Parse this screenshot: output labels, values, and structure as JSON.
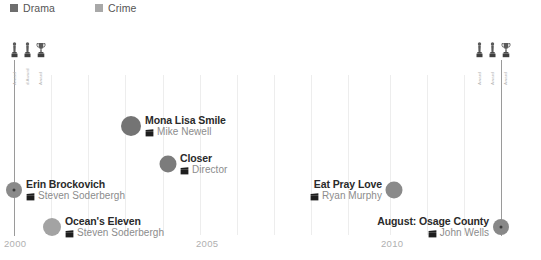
{
  "legend": {
    "items": [
      {
        "label": "Drama",
        "color": "#6e6e6e",
        "x": 10
      },
      {
        "label": "Crime",
        "color": "#a8a8a8",
        "x": 95
      }
    ]
  },
  "chart_data": {
    "type": "scatter",
    "title": "",
    "xlabel": "",
    "ylabel": "",
    "xlim": [
      1999.3,
      2014.2
    ],
    "grid": true,
    "legend_position": "top-left",
    "categories": [
      "Drama",
      "Crime"
    ],
    "tick_labels": [
      "2000",
      "2005",
      "2010"
    ],
    "ticks": [
      {
        "label": "2000",
        "x": 4
      },
      {
        "label": "2005",
        "x": 196
      },
      {
        "label": "2010",
        "x": 381
      }
    ],
    "gridlines_x": [
      14,
      51,
      88,
      125,
      163,
      200,
      237,
      274,
      311,
      348,
      390,
      427,
      464,
      501
    ],
    "axis_lines": [
      {
        "x": 14,
        "top": 42,
        "height": 176,
        "color": "#9a9a9a"
      },
      {
        "x": 501,
        "top": 42,
        "height": 176,
        "color": "#9a9a9a"
      }
    ],
    "points": [
      {
        "title": "Erin Brockovich",
        "director": "Steven Soderbergh",
        "genre": "Drama",
        "x": 14,
        "y": 172,
        "r": 8,
        "color": "#8a8a8a",
        "has_core": true,
        "label_side": "right",
        "label_offset": 12
      },
      {
        "title": "Ocean's Eleven",
        "director": "Steven Soderbergh",
        "genre": "Crime",
        "x": 52,
        "y": 209,
        "r": 9,
        "color": "#a3a3a3",
        "has_core": false,
        "label_side": "right",
        "label_offset": 13
      },
      {
        "title": "Mona Lisa Smile",
        "director": "Mike Newell",
        "genre": "Drama",
        "x": 131,
        "y": 108,
        "r": 10,
        "color": "#747474",
        "has_core": false,
        "label_side": "right",
        "label_offset": 14
      },
      {
        "title": "Closer",
        "director": "Director",
        "genre": "Drama",
        "x": 168,
        "y": 146,
        "r": 8.5,
        "color": "#7c7c7c",
        "has_core": false,
        "label_side": "right",
        "label_offset": 12
      },
      {
        "title": "Eat Pray Love",
        "director": "Ryan Murphy",
        "genre": "Drama",
        "x": 394,
        "y": 172,
        "r": 8.5,
        "color": "#8a8a8a",
        "has_core": false,
        "label_side": "left",
        "label_offset": 12
      },
      {
        "title": "August: Osage County",
        "director": "John Wells",
        "genre": "Drama",
        "x": 501,
        "y": 209,
        "r": 8,
        "color": "#888888",
        "has_core": true,
        "label_side": "left",
        "label_offset": 12
      }
    ]
  },
  "awards": {
    "clusters": [
      {
        "x": 9,
        "y": 24,
        "items": [
          {
            "icon": "oscar-statuette-icon",
            "label": "Award"
          },
          {
            "icon": "oscar-statuette-icon",
            "label": "d Award"
          },
          {
            "icon": "trophy-icon",
            "label": "Award"
          }
        ]
      },
      {
        "x": 474,
        "y": 24,
        "items": [
          {
            "icon": "oscar-statuette-icon",
            "label": "Award"
          },
          {
            "icon": "oscar-statuette-icon",
            "label": "Award"
          },
          {
            "icon": "trophy-icon",
            "label": "Award"
          }
        ]
      }
    ]
  }
}
